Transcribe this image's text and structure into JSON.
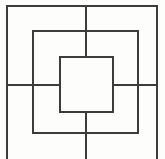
{
  "figure": {
    "canvas": {
      "width": 165,
      "height": 159
    },
    "background_color": "#fdfdfc",
    "stroke_color": "#3c3c3c",
    "stroke_width": 2,
    "center": {
      "x": 86,
      "y": 85
    },
    "squares": [
      {
        "name": "outer-square",
        "label": "Outer square",
        "x1": 7,
        "y1": 6,
        "x2": 157,
        "y2": 168,
        "width": 150,
        "height": 162,
        "clipped_bottom": true
      },
      {
        "name": "middle-square",
        "label": "Middle square",
        "x1": 33,
        "y1": 31,
        "x2": 138,
        "y2": 133,
        "width": 105,
        "height": 102,
        "clipped_bottom": false
      },
      {
        "name": "inner-square",
        "label": "Inner square",
        "x1": 60,
        "y1": 57,
        "x2": 113,
        "y2": 112,
        "width": 53,
        "height": 55,
        "clipped_bottom": false
      }
    ],
    "cross_lines": [
      {
        "name": "vertical-line-top",
        "label": "Vertical center line, upper segment",
        "orientation": "vertical",
        "x1": 86,
        "y1": 6,
        "x2": 86,
        "y2": 57
      },
      {
        "name": "vertical-line-bottom",
        "label": "Vertical center line, lower segment",
        "orientation": "vertical",
        "x1": 86,
        "y1": 112,
        "x2": 86,
        "y2": 159
      },
      {
        "name": "horizontal-line-left",
        "label": "Horizontal center line, left segment",
        "orientation": "horizontal",
        "x1": 7,
        "y1": 85,
        "x2": 60,
        "y2": 85
      },
      {
        "name": "horizontal-line-right",
        "label": "Horizontal center line, right segment",
        "orientation": "horizontal",
        "x1": 113,
        "y1": 85,
        "x2": 157,
        "y2": 85
      }
    ]
  }
}
